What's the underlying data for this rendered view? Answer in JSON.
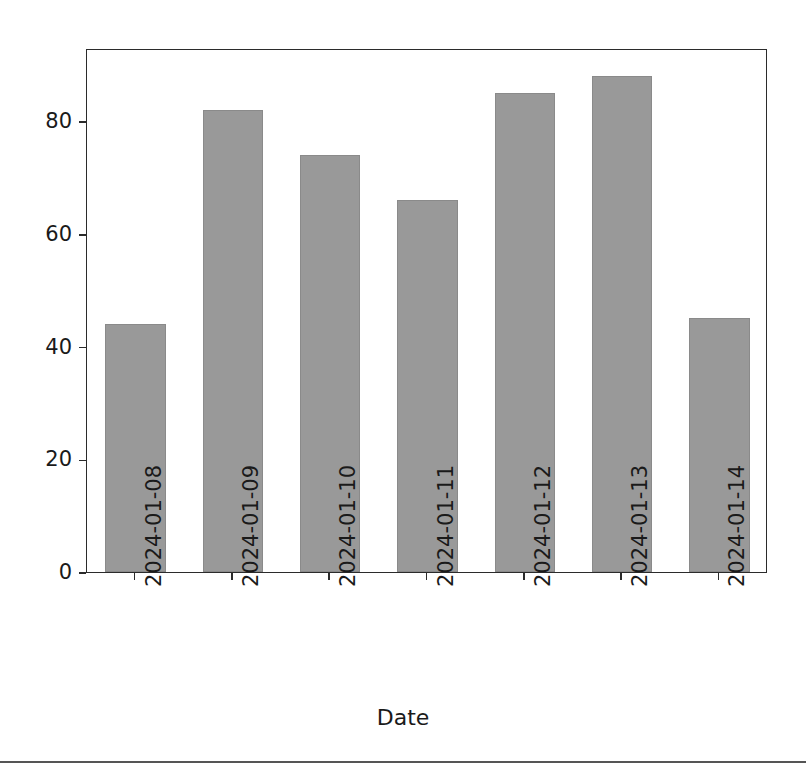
{
  "chart_data": {
    "type": "bar",
    "title": "",
    "xlabel": "Date",
    "ylabel": "",
    "categories": [
      "2024-01-08",
      "2024-01-09",
      "2024-01-10",
      "2024-01-11",
      "2024-01-12",
      "2024-01-13",
      "2024-01-14"
    ],
    "series": [
      {
        "name": "Satisfaction (%)",
        "values": [
          44,
          82,
          74,
          66,
          85,
          88,
          45
        ],
        "color": "#999999"
      }
    ],
    "yticks": [
      0,
      20,
      40,
      60,
      80
    ],
    "ytick_labels": [
      "0",
      "20",
      "40",
      "60",
      "80"
    ],
    "ylim": [
      0,
      93
    ],
    "grid": false,
    "legend": {
      "position": "upper left",
      "entries": [
        {
          "label": "Satisfaction (%)",
          "color": "#999999"
        }
      ]
    },
    "xtick_rotation": -90
  },
  "figure": {
    "background": "#ffffff",
    "axis_color": "#2b2b2b",
    "text_color": "#1a1a1a",
    "bar_color": "#999999",
    "divider_color": "#555555"
  }
}
